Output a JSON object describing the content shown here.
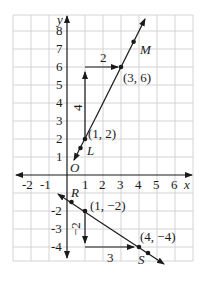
{
  "figure": {
    "axes": {
      "x_label": "x",
      "y_label": "y",
      "origin_label": "O",
      "x_ticks": [
        "-2",
        "-1",
        "1",
        "2",
        "3",
        "4",
        "5",
        "6"
      ],
      "y_ticks": [
        "8",
        "7",
        "6",
        "5",
        "4",
        "3",
        "2",
        "1",
        "-2",
        "-3",
        "-4"
      ],
      "x_range": [
        -3,
        7
      ],
      "y_range": [
        -4.8,
        8.9
      ],
      "grid": true
    },
    "line_LM": {
      "points": [
        {
          "label": "L",
          "x": 0.75,
          "y": 1.5
        },
        {
          "label": "M",
          "x": 3.7,
          "y": 7.4
        }
      ],
      "marked_points": [
        {
          "coord_label": "(1, 2)",
          "x": 1,
          "y": 2
        },
        {
          "coord_label": "(3, 6)",
          "x": 3,
          "y": 6
        }
      ],
      "rise_label": "4",
      "run_label": "2"
    },
    "line_RS": {
      "points": [
        {
          "label": "R",
          "x": 0.25,
          "y": -1.5
        },
        {
          "label": "S",
          "x": 4.5,
          "y": -4.33
        }
      ],
      "marked_points": [
        {
          "coord_label": "(1, −2)",
          "x": 1,
          "y": -2
        },
        {
          "coord_label": "(4, −4)",
          "x": 4,
          "y": -4
        }
      ],
      "rise_label": "−2",
      "run_label": "3"
    },
    "colors": {
      "ink": "#1a1a1a",
      "grid": "#d4d4d4"
    }
  }
}
